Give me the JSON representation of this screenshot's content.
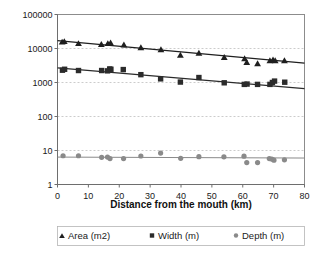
{
  "chart_data": {
    "type": "scatter",
    "title": "",
    "xlabel": "Distance from the mouth (km)",
    "ylabel": "",
    "xlim": [
      0,
      80
    ],
    "ylim": [
      1,
      100000
    ],
    "yscale": "log",
    "xscale": "linear",
    "grid": "horizontal-dashed",
    "legend_position": "bottom",
    "x_ticks": [
      "0",
      "10",
      "20",
      "30",
      "40",
      "50",
      "60",
      "70",
      "80"
    ],
    "x_tick_values": [
      0,
      10,
      20,
      30,
      40,
      50,
      60,
      70,
      80
    ],
    "y_ticks": [
      "1",
      "10",
      "100",
      "1000",
      "10000",
      "100000"
    ],
    "y_tick_values": [
      1,
      10,
      100,
      1000,
      10000,
      100000
    ],
    "series": [
      {
        "name": "Area (m2)",
        "marker": "triangle",
        "color": "#1f1f1f",
        "trendline": true,
        "trend_start": [
          0,
          17000
        ],
        "trend_end": [
          80,
          3700
        ],
        "points": [
          [
            1.5,
            15500
          ],
          [
            2.2,
            16000
          ],
          [
            6.8,
            14000
          ],
          [
            14.2,
            13200
          ],
          [
            16.3,
            14000
          ],
          [
            17.2,
            14500
          ],
          [
            21.5,
            12800
          ],
          [
            27.0,
            10600
          ],
          [
            33.5,
            9200
          ],
          [
            39.8,
            6400
          ],
          [
            45.8,
            7300
          ],
          [
            54.0,
            5500
          ],
          [
            60.6,
            5000
          ],
          [
            61.3,
            3900
          ],
          [
            64.8,
            3600
          ],
          [
            68.8,
            4400
          ],
          [
            69.8,
            4600
          ],
          [
            70.5,
            4400
          ],
          [
            73.5,
            4400
          ]
        ]
      },
      {
        "name": "Width (m)",
        "marker": "square",
        "color": "#2b2b2b",
        "trendline": true,
        "trend_start": [
          0,
          2700
        ],
        "trend_end": [
          80,
          660
        ],
        "points": [
          [
            1.6,
            2300
          ],
          [
            2.3,
            2450
          ],
          [
            6.8,
            2250
          ],
          [
            14.3,
            2250
          ],
          [
            16.2,
            2200
          ],
          [
            16.9,
            2500
          ],
          [
            17.3,
            2450
          ],
          [
            21.3,
            2400
          ],
          [
            27.0,
            1700
          ],
          [
            33.4,
            1280
          ],
          [
            39.8,
            1030
          ],
          [
            45.8,
            1400
          ],
          [
            54.0,
            980
          ],
          [
            60.5,
            880
          ],
          [
            61.4,
            900
          ],
          [
            64.8,
            880
          ],
          [
            68.8,
            880
          ],
          [
            69.6,
            1000
          ],
          [
            70.3,
            1100
          ],
          [
            73.6,
            1020
          ]
        ]
      },
      {
        "name": "Depth (m)",
        "marker": "circle",
        "color": "#8a8a8a",
        "trendline": true,
        "trend_start": [
          0,
          6.4
        ],
        "trend_end": [
          80,
          6.0
        ],
        "points": [
          [
            1.8,
            7.0
          ],
          [
            6.8,
            7.0
          ],
          [
            14.3,
            6.3
          ],
          [
            16.2,
            6.4
          ],
          [
            17.0,
            5.8
          ],
          [
            21.4,
            5.8
          ],
          [
            27.0,
            6.9
          ],
          [
            33.4,
            8.4
          ],
          [
            39.9,
            5.9
          ],
          [
            45.8,
            6.6
          ],
          [
            53.9,
            6.5
          ],
          [
            60.4,
            6.8
          ],
          [
            61.3,
            4.4
          ],
          [
            64.8,
            4.4
          ],
          [
            68.6,
            5.8
          ],
          [
            69.4,
            5.6
          ],
          [
            70.1,
            5.2
          ],
          [
            73.5,
            5.3
          ]
        ]
      }
    ]
  },
  "axes": {
    "x_title": "Distance from the mouth (km)"
  },
  "legend": {
    "items": [
      {
        "label": "Area (m2)",
        "marker": "triangle-marker",
        "color": "#1f1f1f"
      },
      {
        "label": "Width (m)",
        "marker": "square-marker",
        "color": "#2b2b2b"
      },
      {
        "label": "Depth (m)",
        "marker": "circle-marker",
        "color": "#8a8a8a"
      }
    ]
  }
}
